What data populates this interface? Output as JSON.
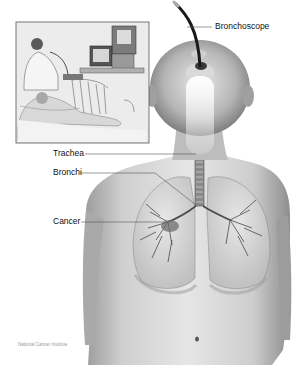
{
  "figure": {
    "labels": {
      "bronchoscope": "Bronchoscope",
      "trachea": "Trachea",
      "bronchi": "Bronchi",
      "cancer": "Cancer"
    },
    "credit": "National Cancer Institute",
    "inset": {
      "description": "Doctor performing bronchoscopy on patient lying in hospital bed with video monitors"
    },
    "colors": {
      "background": "#ffffff",
      "skin_light": "#e4e4e4",
      "skin_mid": "#bdbdbd",
      "skin_dark": "#7d7d7d",
      "scope": "#1a1a1a",
      "leader_line": "#444444",
      "label_text": "#111111"
    }
  }
}
